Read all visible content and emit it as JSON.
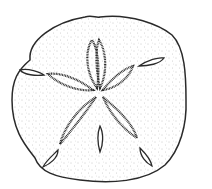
{
  "image": {
    "subject": "sand dollar illustration",
    "style": "black ink stipple line drawing on white",
    "colors": {
      "ink": "#2a2a2a",
      "stipple": "#8a8a8a",
      "background": "#ffffff"
    },
    "petal_count": 5,
    "slit_count": 5
  }
}
